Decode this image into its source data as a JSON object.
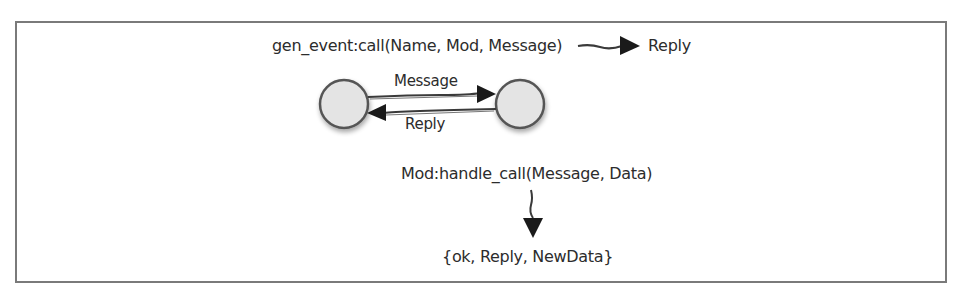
{
  "diagram": {
    "type": "message-flow",
    "frame": {
      "border_color": "#7a7a7a"
    },
    "call_expression": "gen_event:call(Name, Mod, Message)",
    "call_result": "Reply",
    "processes": [
      {
        "id": "caller",
        "fill": "#e4e4e4",
        "stroke": "#555555"
      },
      {
        "id": "event-manager",
        "fill": "#e4e4e4",
        "stroke": "#555555"
      }
    ],
    "arrows": [
      {
        "from": "caller",
        "to": "event-manager",
        "label": "Message"
      },
      {
        "from": "event-manager",
        "to": "caller",
        "label": "Reply"
      }
    ],
    "handler_call": "Mod:handle_call(Message, Data)",
    "handler_result": "{ok, Reply, NewData}"
  }
}
